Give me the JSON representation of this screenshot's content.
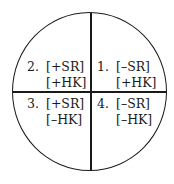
{
  "diagram": {
    "type": "quadrant-circle",
    "quadrants": [
      {
        "position": "top-right",
        "number": "1.",
        "feature1": "[–SR]",
        "feature2": "[+HK]"
      },
      {
        "position": "top-left",
        "number": "2.",
        "feature1": "[+SR]",
        "feature2": "[+HK]"
      },
      {
        "position": "bottom-left",
        "number": "3.",
        "feature1": "[+SR]",
        "feature2": "[–HK]"
      },
      {
        "position": "bottom-right",
        "number": "4.",
        "feature1": "[–SR]",
        "feature2": "[–HK]"
      }
    ],
    "colors": {
      "line": "#1a1a1a",
      "text": "#1a1a1a",
      "background": "#ffffff"
    }
  }
}
